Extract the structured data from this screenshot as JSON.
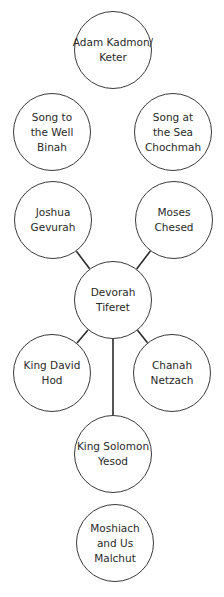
{
  "diagram": {
    "type": "tree-of-sefirot",
    "line_color": "#2a2a2a",
    "nodes": [
      {
        "id": "keter",
        "lines": [
          "Adam Kadmon/",
          "Keter"
        ],
        "cx": 113,
        "cy": 50
      },
      {
        "id": "binah",
        "lines": [
          "Song to",
          "the Well",
          "Binah"
        ],
        "cx": 52,
        "cy": 132
      },
      {
        "id": "chochmah",
        "lines": [
          "Song at",
          "the Sea",
          "Chochmah"
        ],
        "cx": 173,
        "cy": 132
      },
      {
        "id": "gevurah",
        "lines": [
          "Joshua",
          "Gevurah"
        ],
        "cx": 53,
        "cy": 220
      },
      {
        "id": "chesed",
        "lines": [
          "Moses",
          "Chesed"
        ],
        "cx": 174,
        "cy": 220
      },
      {
        "id": "tiferet",
        "lines": [
          "Devorah",
          "Tiferet"
        ],
        "cx": 113,
        "cy": 300
      },
      {
        "id": "hod",
        "lines": [
          "King David",
          "Hod"
        ],
        "cx": 52,
        "cy": 373
      },
      {
        "id": "netzach",
        "lines": [
          "Chanah",
          "Netzach"
        ],
        "cx": 172,
        "cy": 373
      },
      {
        "id": "yesod",
        "lines": [
          "King Solomon",
          "Yesod"
        ],
        "cx": 113,
        "cy": 454
      },
      {
        "id": "malchut",
        "lines": [
          "Moshiach",
          "and Us",
          "Malchut"
        ],
        "cx": 115,
        "cy": 543
      }
    ],
    "edges": [
      [
        "gevurah",
        "tiferet"
      ],
      [
        "chesed",
        "tiferet"
      ],
      [
        "tiferet",
        "hod"
      ],
      [
        "tiferet",
        "netzach"
      ],
      [
        "tiferet",
        "yesod"
      ]
    ]
  }
}
